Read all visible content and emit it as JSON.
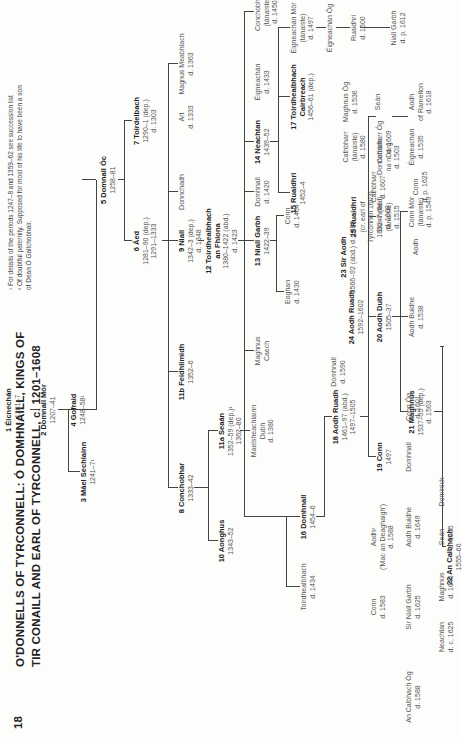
{
  "page": {
    "number": "18",
    "title_line1": "O'DONNELLS OF TYRCONNELL: Ó DOMHNAILL, KINGS OF",
    "title_line2": "TIR CONAILL AND EARL OF TYRCONNELL, c. 1201–1608"
  },
  "footnotes": [
    "¹ For details of the periods 1247–8 and 1359–62 see succession list",
    "² Of doubtful paternity. Supposed for most of his life to have been a son",
    "   of Dean Ó Gallchobhair."
  ],
  "nodes": {
    "eicnechan": {
      "name": "1 Éicnechán",
      "d1": "c. 1201–7"
    },
    "domnall_mor": {
      "name": "2 Domnall Mór",
      "d1": "1207–41"
    },
    "mael_sechlainn": {
      "name": "3 Máel Sechlainn",
      "d1": "1241–7¹"
    },
    "gofraid": {
      "name": "4 Gofraid",
      "d1": "1248–58¹"
    },
    "domnall_oc": {
      "name": "5 Domnall Óc",
      "d1": "1258–81"
    },
    "aed6": {
      "name": "6 Áed",
      "d1": "1281–90 (dep.)",
      "d2": "1291–1333"
    },
    "toirdelbach7": {
      "name": "7 Toirdelbach",
      "d1": "1290–1 (dep.)",
      "d2": "d. 1303"
    },
    "conchobar8": {
      "name": "8 Conchobhar",
      "d1": "1333–42"
    },
    "niall9": {
      "name": "9 Niall",
      "d1": "1342–3 (dep.)",
      "d2": "d. 1348"
    },
    "donnchadh_a": {
      "name": "Donnchadh"
    },
    "art": {
      "name": "Art",
      "d1": "d. 1333"
    },
    "magnus_meabhlach": {
      "name": "Magnus Meabhlach",
      "d1": "d. 1363"
    },
    "aonghus10": {
      "name": "10 Aonghus",
      "d1": "1343–52"
    },
    "seaan11a": {
      "name": "11a Seaán",
      "d1": "1352–59 (dep.)¹",
      "d2": "1362–80"
    },
    "feidhlimidh11b": {
      "name": "11b Feidhlimidh",
      "d1": "1352–6"
    },
    "toirdhealbhach12": {
      "name": "12 Toirdhealbhach",
      "d1": "an Fhiona",
      "d2": "1380–1422 (abd.)",
      "d3": "d. 1423"
    },
    "maelsechlainn_dubh": {
      "name": "Maelsheachlainn",
      "d1": "Dubh",
      "d2": "d. 1380"
    },
    "magnus_caech": {
      "name": "Maghnus",
      "d1": "Caech"
    },
    "niall_garbh13": {
      "name": "13 Niall Garbh",
      "d1": "1422–39"
    },
    "domhnall_d1420": {
      "name": "Domhnall",
      "d1": "d. 1420"
    },
    "neachtan14": {
      "name": "14 Neachtan",
      "d1": "1439–52"
    },
    "eigneachan_d1433": {
      "name": "Éigneachán",
      "d1": "d. 1433"
    },
    "conchobhar_d1450": {
      "name": "Conchobhar",
      "d1": "(tánaiste)",
      "d2": "d. 1450"
    },
    "toirdhealbhach_d1434": {
      "name": "Toirdhealbhach",
      "d1": "d. 1434"
    },
    "domhnall16": {
      "name": "16 Domhnall",
      "d1": "1454–6"
    },
    "eoghan_d1430": {
      "name": "Eoghan",
      "d1": "d. 1430"
    },
    "conn_d1464": {
      "name": "Conn",
      "d1": "d. 1464"
    },
    "ruaidhri15": {
      "name": "15 Ruaidhri",
      "d1": "1452–4"
    },
    "toirdhealbhach17": {
      "name": "17 Toirdhealbhach",
      "d1": "Cairbreach",
      "d2": "1456–61 (dep.)"
    },
    "eigneachan_mor": {
      "name": "Éigneachán Mór",
      "d1": "(tánaiste)",
      "d2": "d. 1497"
    },
    "eigneachan_og": {
      "name": "Éigneachán Óg"
    },
    "ruaidhri_d1500": {
      "name": "Ruaidhri",
      "d1": "d. 1500"
    },
    "niall_garbh_d1612": {
      "name": "Niall Garbh",
      "d1": "d. p. 1612"
    },
    "aodh_ruadh18": {
      "name": "18 Aodh Ruadh",
      "d1": "1461–97 (abd.)",
      "d2": "1497–1505"
    },
    "conn19": {
      "name": "19 Conn",
      "d1": "1497"
    },
    "aodh_dubh20": {
      "name": "20 Aodh Dubh",
      "d1": "1505–37"
    },
    "domhnall_tanaiste_1515": {
      "name": "Domhnall",
      "d1": "(tánaiste)",
      "d2": "d. 1515"
    },
    "donnchadh_na_ndorg": {
      "name": "Donnchadh",
      "d1": "na nDorg",
      "d2": "d. 1503"
    },
    "maghnus21": {
      "name": "21 Maghnus",
      "d1": "1537–55 (dep.)",
      "d2": "d. 1563"
    },
    "aodh_buidhe_1538": {
      "name": "Aodh Buidhe",
      "d1": "d. 1538"
    },
    "conn_mor": {
      "name": "Conn Mór",
      "d1": "(tánaiste)",
      "d2": "d. p. 1549"
    },
    "eigneachan_1535": {
      "name": "Éigneachán",
      "d1": "d. 1535"
    },
    "aodh_of_ramelton": {
      "name": "Aodh",
      "d1": "of Ramelton",
      "d2": "d. 1618"
    },
    "an_calbhach22": {
      "name": "22 An Calbhach",
      "d1": "1555–66"
    },
    "sir_aodh23": {
      "name": "23 Sir Aodh",
      "d1": "1566–92 (abd.) d. 1600"
    },
    "aodh_ruadh24": {
      "name": "24 Aodh Ruadh",
      "d1": "1592–1602"
    },
    "ruaidhri25": {
      "name": "25 Ruaidhri",
      "d1": "(cr. earl of",
      "d2": "Tyrconnell 1603)",
      "d3": "1602–7 (fled)",
      "d4": "d. 1608"
    },
    "domhnall_d1590": {
      "name": "Domhnall",
      "d1": "d. 1590"
    },
    "cathbharr_tanaiste": {
      "name": "Cathbharr",
      "d1": "(tánaiste)",
      "d2": "d. 1580"
    },
    "maghnus_og": {
      "name": "Maghnus Óg",
      "d1": "d. 1536"
    },
    "cathbharr_og": {
      "name": "Cathbharr Óg",
      "d1": "d. 1609"
    },
    "sean_a": {
      "name": "Seán"
    },
    "cathbharr_1607": {
      "name": "Cathbharr",
      "d1": "d. 1607"
    },
    "conn_d1625": {
      "name": "Conn",
      "d1": "d. p. 1625"
    },
    "aodh_son_ruaidhri": {
      "name": "Aodh"
    },
    "conn_d1583": {
      "name": "Conn",
      "d1": "d. 1583"
    },
    "aodh_mac_an_deagh": {
      "name": "Aodh²",
      "d1": "('Mac an Deaghaigh')",
      "d2": "d. 1588"
    },
    "an_calbhach_og": {
      "name": "An Calbhach Óg",
      "d1": "d. 1588"
    },
    "sir_niall_garbh": {
      "name": "Sir Niall Garbh",
      "d1": "d. 1625"
    },
    "aodh_buidhe_1649": {
      "name": "Aodh Buidhe",
      "d1": "d. 1649"
    },
    "domhnall_b": {
      "name": "Domhnall"
    },
    "conn_og": {
      "name": "Conn Óg",
      "d1": "d. 1601"
    },
    "neachtan_1625": {
      "name": "Neachtan",
      "d1": "d. c. 1625"
    },
    "maghnus_1646": {
      "name": "Maghnus",
      "d1": "d. 1646"
    },
    "sean_1555": {
      "name": "Seán",
      "d1": "d. 1555"
    },
    "dominick": {
      "name": "Dominick"
    }
  }
}
